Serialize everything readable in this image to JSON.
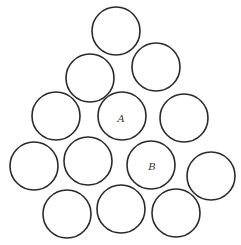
{
  "diagram": {
    "stroke_color": "#2a2a2a",
    "background": "#ffffff",
    "radius": 24,
    "circles": [
      {
        "id": "c1",
        "cx": 116,
        "cy": 31,
        "label": ""
      },
      {
        "id": "c2",
        "cx": 90,
        "cy": 78,
        "label": ""
      },
      {
        "id": "c3",
        "cx": 156,
        "cy": 67,
        "label": ""
      },
      {
        "id": "c4",
        "cx": 56,
        "cy": 116,
        "label": ""
      },
      {
        "id": "cA",
        "cx": 122,
        "cy": 116,
        "label": "A"
      },
      {
        "id": "c5",
        "cx": 184,
        "cy": 118,
        "label": ""
      },
      {
        "id": "c6",
        "cx": 34,
        "cy": 166,
        "label": ""
      },
      {
        "id": "c7",
        "cx": 88,
        "cy": 161,
        "label": ""
      },
      {
        "id": "cB",
        "cx": 151,
        "cy": 165,
        "label": "B"
      },
      {
        "id": "c8",
        "cx": 211,
        "cy": 176,
        "label": ""
      },
      {
        "id": "c9",
        "cx": 67,
        "cy": 214,
        "label": ""
      },
      {
        "id": "c10",
        "cx": 121,
        "cy": 209,
        "label": ""
      },
      {
        "id": "c11",
        "cx": 176,
        "cy": 213,
        "label": ""
      }
    ],
    "labels": {
      "a": "A",
      "b": "B"
    }
  }
}
